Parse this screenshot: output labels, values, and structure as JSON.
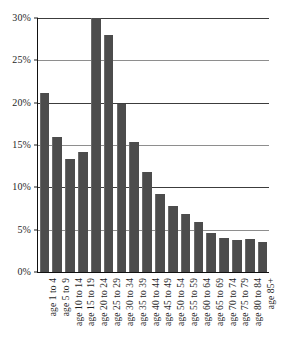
{
  "chart_data": {
    "type": "bar",
    "title": "",
    "subtitle": "",
    "xlabel": "",
    "ylabel": "",
    "ylim": [
      0,
      30
    ],
    "ytick_values": [
      0,
      5,
      10,
      15,
      20,
      25,
      30
    ],
    "ytick_labels": [
      "0%",
      "5%",
      "10%",
      "15%",
      "20%",
      "25%",
      "30%"
    ],
    "grid": "horizontal",
    "legend": "none",
    "bar_color": "#4c4c4c",
    "gridline_color": "#8e8e8e",
    "axis_color": "#111111",
    "background_color": "#ffffff",
    "categories": [
      "age 1 to 4",
      "age 5 to 9",
      "age 10 to 14",
      "age 15 to 19",
      "age 20 to 24",
      "age 25 to 29",
      "age 30 to 34",
      "age 35 to 39",
      "age 40 to 44",
      "age 45 to 49",
      "age 50 to 54",
      "age 55 to 59",
      "age 60 to 64",
      "age 65 to 69",
      "age 70 to 74",
      "age 75 to 79",
      "age 80 to 84",
      "age 85+"
    ],
    "values": [
      21.1,
      15.9,
      13.3,
      14.2,
      30.0,
      28.0,
      19.8,
      15.3,
      11.8,
      9.2,
      7.8,
      6.8,
      5.9,
      4.6,
      4.0,
      3.8,
      3.9,
      3.5
    ],
    "value_unit": "%"
  }
}
